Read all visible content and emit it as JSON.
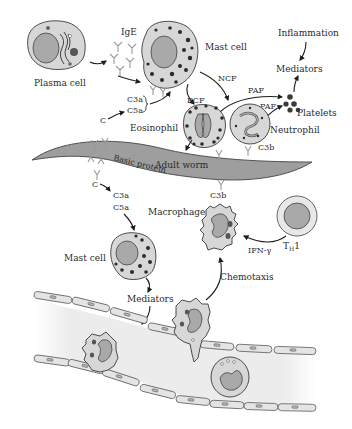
{
  "figure": {
    "colors": {
      "worm": "#9e9e9e",
      "cell_fill": "#d7d7d7",
      "nucleus": "#a9a9a9",
      "vessel_lumen": "#ececec",
      "granule": "#2b2b2b",
      "antibody": "#9a9a9a",
      "line": "#1e1e1e"
    },
    "labels": {
      "plasma_cell": "Plasma cell",
      "ige": "IgE",
      "mast_cell_top": "Mast cell",
      "inflammation": "Inflammation",
      "mediators_top": "Mediators",
      "ncf": "NCF",
      "ecf": "ECF",
      "paf_1": "PAF",
      "paf_2": "PAF",
      "platelets": "Platelets",
      "c_top": "C",
      "c3a_top": "C3a",
      "c5a_top": "C5a",
      "eosinophil": "Eosinophil",
      "neutrophil": "Neutrophil",
      "c3b_neutrophil": "C3b",
      "basic_protein": "Basic protein",
      "adult_worm": "Adult worm",
      "c_bottom": "C",
      "c3a_bottom": "C3a",
      "c5a_bottom": "C5a",
      "c3b_macrophage": "C3b",
      "macrophage": "Macrophage",
      "th1_main": "T",
      "th1_sub": "H",
      "th1_suffix": "1",
      "ifn_gamma": "IFN-γ",
      "mast_cell_bottom": "Mast cell",
      "chemotaxis": "Chemotaxis",
      "mediators_bottom": "Mediators"
    }
  }
}
